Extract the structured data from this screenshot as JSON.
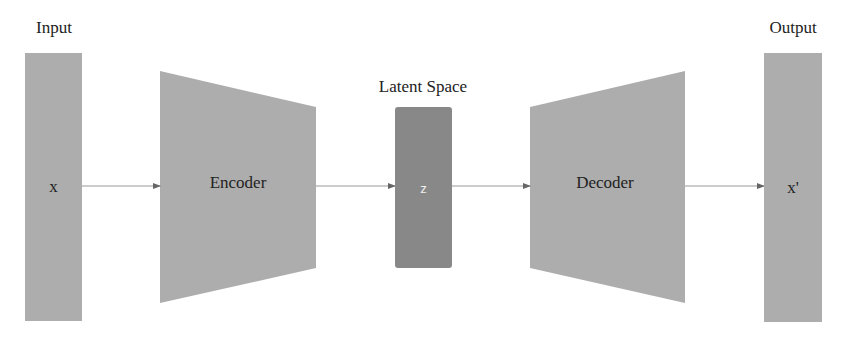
{
  "diagram": {
    "nodes": {
      "input": {
        "heading": "Input",
        "symbol": "x"
      },
      "encoder": {
        "label": "Encoder"
      },
      "latent": {
        "heading": "Latent Space",
        "symbol": "z"
      },
      "decoder": {
        "label": "Decoder"
      },
      "output": {
        "heading": "Output",
        "symbol": "x'"
      }
    },
    "edges": [
      {
        "from": "input",
        "to": "encoder"
      },
      {
        "from": "encoder",
        "to": "latent"
      },
      {
        "from": "latent",
        "to": "decoder"
      },
      {
        "from": "decoder",
        "to": "output"
      }
    ],
    "colors": {
      "block": "#adadad",
      "latent": "#888888",
      "arrow": "#999999",
      "text": "#222222",
      "latent_text": "#f0f0f0"
    }
  }
}
